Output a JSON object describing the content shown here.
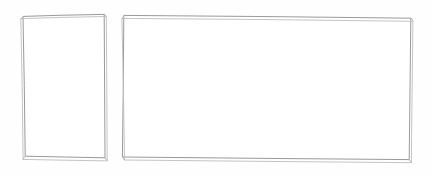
{
  "canvas": {
    "width": 432,
    "height": 176,
    "background_color": "#fefefe",
    "description": "Blank sketch canvas containing two empty hand-drawn rectangular outlines"
  },
  "style": {
    "stroke_primary_color": "#9a9a9a",
    "stroke_secondary_color": "#bdbdbd",
    "stroke_tick_color": "#b2b2b2",
    "surface_fill_color": "#ffffff",
    "stroke_width_primary": 1,
    "stroke_width_secondary": 0.9,
    "render_style": "hand-drawn-double-stroke"
  },
  "shapes": [
    {
      "id": "portrait-card",
      "name": "left-portrait-rectangle",
      "orientation": "portrait",
      "content": "",
      "x": 23,
      "y": 14,
      "width": 82,
      "height": 144,
      "corners": {
        "top_left": [
          23,
          16
        ],
        "top_right": [
          104,
          14
        ],
        "bottom_right": [
          105,
          158
        ],
        "bottom_left": [
          25,
          156
        ]
      },
      "outer_corners": {
        "top_left": [
          21,
          18
        ],
        "top_right": [
          106,
          16
        ],
        "bottom_right": [
          107,
          161
        ],
        "bottom_left": [
          23,
          159
        ]
      }
    },
    {
      "id": "landscape-card",
      "name": "right-landscape-rectangle",
      "orientation": "landscape",
      "content": "",
      "x": 122,
      "y": 14,
      "width": 290,
      "height": 146,
      "corners": {
        "top_left": [
          124,
          15
        ],
        "top_right": [
          411,
          18
        ],
        "bottom_right": [
          409,
          160
        ],
        "bottom_left": [
          122,
          157
        ]
      },
      "outer_corners": {
        "top_left": [
          122,
          18
        ],
        "top_right": [
          413,
          21
        ],
        "bottom_right": [
          411,
          163
        ],
        "bottom_left": [
          124,
          160
        ]
      }
    }
  ]
}
